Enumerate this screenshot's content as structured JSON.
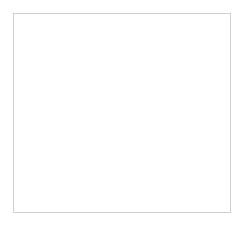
{
  "chart_data": {
    "type": "bar",
    "xlabel": "stations",
    "ylabel": "pH",
    "categories": [
      "SH up",
      "SHI 1",
      "SHI2",
      "SHI3",
      "SH down"
    ],
    "series": [
      {
        "name": "PH",
        "color": "#8c8c8c",
        "values": [
          8.15,
          7.82,
          7.37,
          7.18,
          7.35
        ]
      },
      {
        "name": "average",
        "color": "#5a5a5a",
        "values": [
          7.57,
          7.57,
          7.57,
          7.57,
          7.57
        ]
      }
    ],
    "ylim": [
      6.6,
      8.4
    ],
    "yticks": [
      "8.4",
      "8.2",
      "8",
      "7.8",
      "7.6",
      "7.4",
      "7.2",
      "7",
      "6.8",
      "6.6"
    ],
    "grid": true,
    "legend_position": "bottom"
  }
}
